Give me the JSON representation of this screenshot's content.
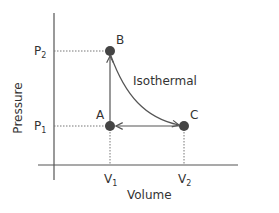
{
  "diagram": {
    "type": "pv-diagram",
    "axes": {
      "x_label": "Volume",
      "y_label": "Pressure",
      "x_ticks": [
        {
          "label": "V",
          "sub": "1"
        },
        {
          "label": "V",
          "sub": "2"
        }
      ],
      "y_ticks": [
        {
          "label": "P",
          "sub": "2"
        },
        {
          "label": "P",
          "sub": "1"
        }
      ]
    },
    "points": [
      {
        "id": "A",
        "label": "A",
        "volume": "V1",
        "pressure": "P1"
      },
      {
        "id": "B",
        "label": "B",
        "volume": "V1",
        "pressure": "P2"
      },
      {
        "id": "C",
        "label": "C",
        "volume": "V2",
        "pressure": "P1"
      }
    ],
    "processes": [
      {
        "from": "A",
        "to": "B",
        "kind": "isochoric",
        "label": ""
      },
      {
        "from": "B",
        "to": "C",
        "kind": "isothermal",
        "label": "Isothermal"
      },
      {
        "from": "C",
        "to": "A",
        "kind": "isobaric",
        "label": ""
      }
    ],
    "curve_label": "Isothermal",
    "colors": {
      "line": "#555555",
      "point": "#444444",
      "dotted": "#777777",
      "text": "#333333"
    }
  }
}
